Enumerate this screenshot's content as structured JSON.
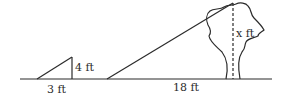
{
  "diagram": {
    "type": "similar-triangles-shadow",
    "labels": {
      "small_height": "4 ft",
      "small_base": "3 ft",
      "large_base": "18 ft",
      "tree_height": "x ft"
    },
    "colors": {
      "stroke": "#2b2b2b",
      "background": "#ffffff"
    }
  }
}
